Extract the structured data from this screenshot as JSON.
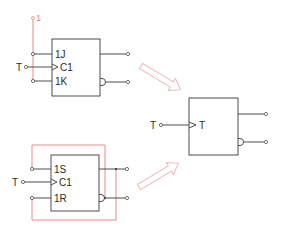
{
  "diagram": {
    "title": "",
    "colors": {
      "line": "#3a3a3a",
      "wiring": "#e08080",
      "arrow": "#eeb0b0"
    },
    "flipflops": [
      {
        "id": "jk",
        "inputs": [
          {
            "label": "1J"
          },
          {
            "label": "C1"
          },
          {
            "label": "1K"
          }
        ],
        "clock_input_label": "T",
        "tie_label": "1"
      },
      {
        "id": "sr",
        "inputs": [
          {
            "label": "1S"
          },
          {
            "label": "C1"
          },
          {
            "label": "1R"
          }
        ],
        "clock_input_label": "T"
      },
      {
        "id": "t",
        "inputs": [
          {
            "label": "T"
          }
        ],
        "clock_input_label": "T"
      }
    ],
    "arrows": [
      {
        "from": "jk",
        "to": "t"
      },
      {
        "from": "sr",
        "to": "t"
      }
    ]
  }
}
